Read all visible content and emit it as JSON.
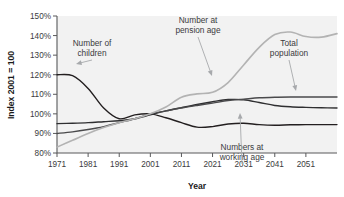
{
  "chart_data": {
    "type": "line",
    "title": "",
    "xlabel": "Year",
    "ylabel": "Index 2001 = 100",
    "xlim": [
      1971,
      2061
    ],
    "ylim": [
      80,
      150
    ],
    "ytick_labels": [
      "150%",
      "140%",
      "130%",
      "120%",
      "110%",
      "100%",
      "90%",
      "80%"
    ],
    "ytick_values": [
      150,
      140,
      130,
      120,
      110,
      100,
      90,
      80
    ],
    "xtick_labels": [
      "1971",
      "1981",
      "1991",
      "2001",
      "2011",
      "2021",
      "2031",
      "2041",
      "2051"
    ],
    "xtick_values": [
      1971,
      1981,
      1991,
      2001,
      2011,
      2021,
      2031,
      2041,
      2051
    ],
    "grid": false,
    "legend_position": "inline-annotations",
    "x": [
      1971,
      1976,
      1981,
      1986,
      1991,
      1996,
      2001,
      2006,
      2011,
      2016,
      2021,
      2026,
      2031,
      2036,
      2041,
      2046,
      2051,
      2056,
      2061
    ],
    "series": [
      {
        "name": "Number of children",
        "color": "#231f20",
        "values": [
          120,
          119.5,
          113,
          103,
          97.5,
          99.5,
          100,
          98,
          95.5,
          93.2,
          93.5,
          94.8,
          95.2,
          94.5,
          94.2,
          94.4,
          94.5,
          94.5,
          94.5
        ]
      },
      {
        "name": "Numbers at working age",
        "color": "#2f2f31",
        "values": [
          95,
          95.2,
          95.5,
          96,
          96.5,
          97.5,
          99.5,
          101.5,
          103.2,
          104.8,
          106.2,
          107.3,
          107.2,
          105.8,
          104.3,
          103.6,
          103.3,
          103.1,
          103.0
        ]
      },
      {
        "name": "Total population",
        "color": "#4a4a4c",
        "values": [
          90,
          90.8,
          92,
          93.5,
          95.5,
          97.5,
          100,
          101.5,
          103,
          104.3,
          105.5,
          106.8,
          107.5,
          108.2,
          108.5,
          108.6,
          108.6,
          108.6,
          108.6
        ]
      },
      {
        "name": "Number at pension age",
        "color": "#b3b3b3",
        "values": [
          83,
          86.5,
          90,
          93,
          95.5,
          97.5,
          100,
          103.5,
          108.5,
          110.2,
          111,
          116,
          125,
          134,
          140.5,
          141.8,
          139.5,
          139.2,
          141
        ]
      }
    ],
    "annotations": [
      {
        "name": "children",
        "line1": "Number of",
        "line2": "children",
        "x": 92,
        "y": 46,
        "target_x": 76,
        "target_y": 64
      },
      {
        "name": "pension",
        "line1": "Number at",
        "line2": "pension age",
        "x": 198,
        "y": 23,
        "target_x": 212,
        "target_y": 76
      },
      {
        "name": "total-population",
        "line1": "Total",
        "line2": "population",
        "x": 289,
        "y": 46,
        "target_x": 296,
        "target_y": 91
      },
      {
        "name": "working-age",
        "line1": "Numbers at",
        "line2": "working age",
        "x": 242,
        "y": 150,
        "target_x": 240,
        "target_y": 113
      }
    ]
  }
}
